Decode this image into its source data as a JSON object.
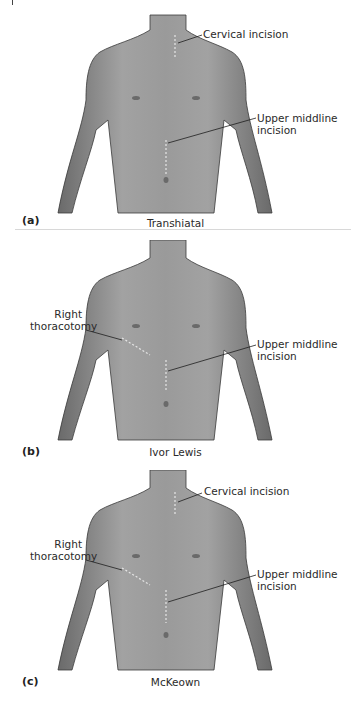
{
  "figure": {
    "colors": {
      "skin": "#8c8c8c",
      "skin_light": "#b4b4b4",
      "skin_dark": "#5e5e5e",
      "outline": "#3a3a3a",
      "incision": "#e6e6e6",
      "leader": "#1e1e1e",
      "background": "#ffffff"
    },
    "panels": [
      {
        "tag": "(a)",
        "caption": "Transhiatal",
        "labels": {
          "cervical": "Cervical incision",
          "upper_middle_line1": "Upper middline",
          "upper_middle_line2": "incision"
        }
      },
      {
        "tag": "(b)",
        "caption": "Ivor Lewis",
        "labels": {
          "right_thoracotomy_line1": "Right",
          "right_thoracotomy_line2": "thoracotomy",
          "upper_middle_line1": "Upper middline",
          "upper_middle_line2": "incision"
        }
      },
      {
        "tag": "(c)",
        "caption": "McKeown",
        "labels": {
          "cervical": "Cervical incision",
          "right_thoracotomy_line1": "Right",
          "right_thoracotomy_line2": "thoracotomy",
          "upper_middle_line1": "Upper middline",
          "upper_middle_line2": "incision"
        }
      }
    ]
  }
}
